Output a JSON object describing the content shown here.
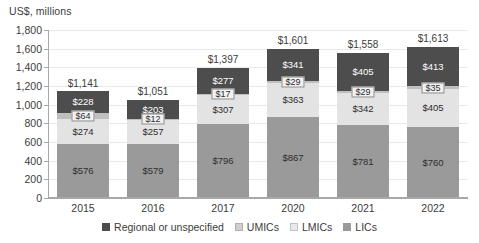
{
  "chart_data": {
    "type": "bar",
    "stacked": true,
    "title": "",
    "subtitle": "",
    "ylabel": "US$, millions",
    "xlabel": "",
    "ylim": [
      0,
      1800
    ],
    "ytick_step": 200,
    "yticks": [
      "1,800",
      "1,600",
      "1,400",
      "1,200",
      "1,000",
      "800",
      "600",
      "400",
      "200",
      "0"
    ],
    "ytick_values": [
      1800,
      1600,
      1400,
      1200,
      1000,
      800,
      600,
      400,
      200,
      0
    ],
    "grid": true,
    "legend_position": "bottom",
    "categories": [
      "2015",
      "2016",
      "2017",
      "2020",
      "2021",
      "2022"
    ],
    "series": [
      {
        "name": "LICs",
        "color": "#9a9a9a",
        "values": [
          576,
          579,
          796,
          867,
          781,
          760
        ],
        "labels": [
          "$576",
          "$579",
          "$796",
          "$867",
          "$781",
          "$760"
        ]
      },
      {
        "name": "LMICs",
        "color": "#e3e3e3",
        "values": [
          274,
          257,
          307,
          363,
          342,
          405
        ],
        "labels": [
          "$274",
          "$257",
          "$307",
          "$363",
          "$342",
          "$405"
        ]
      },
      {
        "name": "UMICs",
        "color": "#bfbfbf",
        "values": [
          64,
          12,
          17,
          29,
          29,
          35
        ],
        "labels": [
          "$64",
          "$12",
          "$17",
          "$29",
          "$29",
          "$35"
        ]
      },
      {
        "name": "Regional or unspecified",
        "color": "#4d4d4d",
        "values": [
          228,
          203,
          277,
          341,
          405,
          413
        ],
        "labels": [
          "$228",
          "$203",
          "$277",
          "$341",
          "$405",
          "$413"
        ]
      }
    ],
    "totals": [
      1141,
      1051,
      1397,
      1601,
      1558,
      1613
    ],
    "total_labels": [
      "$1,141",
      "$1,051",
      "$1,397",
      "$1,601",
      "$1,558",
      "$1,613"
    ]
  },
  "legend": {
    "items": [
      {
        "label": "Regional or unspecified",
        "swatch_class": "sw-regional",
        "color": "#4d4d4d"
      },
      {
        "label": "UMICs",
        "swatch_class": "sw-umics",
        "color": "#cfcfcf"
      },
      {
        "label": "LMICs",
        "swatch_class": "sw-lmics",
        "color": "#e8e8e8"
      },
      {
        "label": "LICs",
        "swatch_class": "sw-lics",
        "color": "#9a9a9a"
      }
    ]
  }
}
